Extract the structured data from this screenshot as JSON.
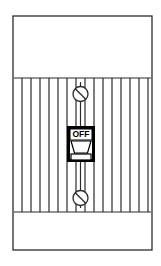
{
  "figure": {
    "title": "Wall light switch in OFF position",
    "type": "line-art-technical-illustration",
    "width": 161,
    "height": 266,
    "background_color": "#ffffff",
    "line_color": "#2b2b2b",
    "accent_color": "#000000"
  },
  "wall_panel": {
    "label": "wall-panel-outline",
    "x": 13,
    "y": 16,
    "width": 139,
    "height": 234,
    "stroke_width": 1.3
  },
  "siding": {
    "label": "vertical-siding-hatch",
    "top": 78,
    "bottom": 212,
    "left": 14,
    "right": 151,
    "line_count": 15,
    "stroke_width": 1.2,
    "x_positions": [
      22,
      31,
      40,
      49,
      58,
      67,
      76,
      85,
      94,
      103,
      112,
      121,
      130,
      139,
      148
    ]
  },
  "switch_plate": {
    "label": "switch-plate-center-line",
    "center_x": 80.5,
    "top": 82,
    "bottom": 208,
    "stroke_width": 1.2
  },
  "screws": [
    {
      "name": "top-mounting-screw",
      "cx": 80.5,
      "cy": 94,
      "r": 7.5,
      "slot_angle_deg": 45,
      "stroke_width": 1.3
    },
    {
      "name": "bottom-mounting-screw",
      "cx": 80.5,
      "cy": 198,
      "r": 7.5,
      "slot_angle_deg": 45,
      "stroke_width": 1.3
    }
  ],
  "switch": {
    "state_label": "OFF",
    "body": {
      "x": 67,
      "y": 126,
      "width": 28,
      "height": 36,
      "border_width": 3,
      "fill": "#ffffff",
      "stroke": "#000000"
    },
    "label_box": {
      "x": 70,
      "y": 129,
      "width": 22,
      "height": 11,
      "fill": "#ffffff",
      "stroke": "#000000",
      "text": "OFF",
      "font_size": 8.5,
      "font_weight": "bold"
    },
    "rocker": {
      "name": "rocker-paddle",
      "top_left_x": 71,
      "top_right_x": 91,
      "top_y": 141,
      "bottom_left_x": 74.5,
      "bottom_right_x": 87.5,
      "bottom_y": 153,
      "fill": "#ffffff",
      "stroke": "#000000"
    },
    "lower_slot": {
      "name": "rocker-lower-gap",
      "x": 71,
      "y": 154,
      "width": 20,
      "height": 6,
      "fill": "#ffffff",
      "stroke": "#000000"
    }
  }
}
